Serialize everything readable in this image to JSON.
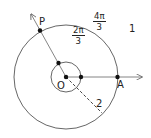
{
  "figure": {
    "geometry": {
      "center": {
        "x": 66,
        "y": 77
      },
      "outer_radius": 52,
      "inner_radius": 15,
      "ray_angle_deg": 120,
      "dashed_angle_deg": -45
    },
    "points": {
      "origin": "O",
      "point_on_ray": "P",
      "point_on_axis": "A"
    },
    "labels": {
      "fraction_2pi_3": {
        "num": "2π",
        "den": "3"
      },
      "fraction_4pi_3": {
        "num": "4π",
        "den": "3"
      },
      "one": "1",
      "two": "2"
    },
    "colors": {
      "stroke": "#555555",
      "point": "#111111",
      "text": "#222222"
    }
  }
}
